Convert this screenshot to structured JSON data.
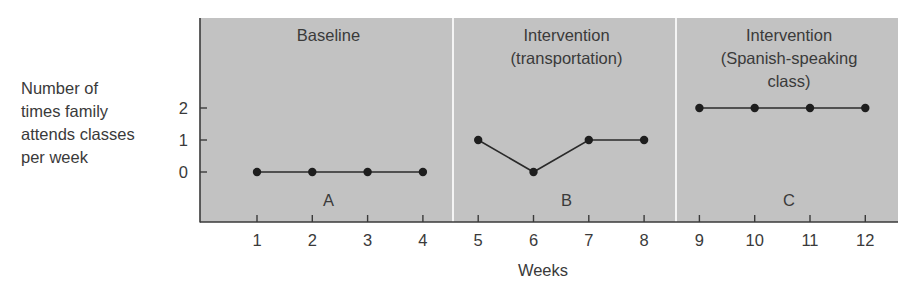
{
  "chart_data": {
    "type": "line",
    "title": "",
    "xlabel": "Weeks",
    "ylabel": "Number of times family attends classes per week",
    "ylabel_lines": [
      "Number of",
      "times family",
      "attends classes",
      "per week"
    ],
    "x": [
      1,
      2,
      3,
      4,
      5,
      6,
      7,
      8,
      9,
      10,
      11,
      12
    ],
    "x_tick_labels": [
      "1",
      "2",
      "3",
      "4",
      "5",
      "6",
      "7",
      "8",
      "9",
      "10",
      "11",
      "12"
    ],
    "y_ticks": [
      0,
      1,
      2
    ],
    "y_tick_labels": [
      "0",
      "1",
      "2"
    ],
    "grid": false,
    "legend": null,
    "phases": [
      {
        "letter": "A",
        "title_lines": [
          "Baseline"
        ],
        "weeks": [
          1,
          2,
          3,
          4
        ],
        "values": [
          0,
          0,
          0,
          0
        ]
      },
      {
        "letter": "B",
        "title_lines": [
          "Intervention",
          "(transportation)"
        ],
        "weeks": [
          5,
          6,
          7,
          8
        ],
        "values": [
          1,
          0,
          1,
          1
        ]
      },
      {
        "letter": "C",
        "title_lines": [
          "Intervention",
          "(Spanish-speaking",
          "class)"
        ],
        "weeks": [
          9,
          10,
          11,
          12
        ],
        "values": [
          2,
          2,
          2,
          2
        ]
      }
    ],
    "series": [
      {
        "name": "Attendance",
        "values": [
          0,
          0,
          0,
          0,
          1,
          0,
          1,
          1,
          2,
          2,
          2,
          2
        ]
      }
    ]
  },
  "colors": {
    "panel_fill": "#c2c2c2",
    "divider": "#f4f4f4",
    "axis": "#3a3a3a",
    "line": "#2a2a2a",
    "marker": "#1e1e1e",
    "text": "#3a3a3a"
  }
}
